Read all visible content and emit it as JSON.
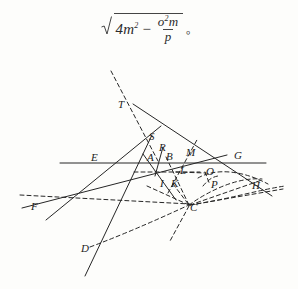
{
  "formula": {
    "name": "square-root-expression",
    "radical_symbol": "√",
    "term1_base": "4m",
    "term1_exp": "2",
    "operator": "−",
    "fraction_numerator_base": "o",
    "fraction_numerator_exp": "2",
    "fraction_numerator_tail": "m",
    "fraction_denominator": "p",
    "trailing_punctuation": "。",
    "plain_text": "√(4m² − o²m/p)。"
  },
  "figure": {
    "stroke_color": "#262626",
    "background_color": "#fdfdfb",
    "point_labels": [
      {
        "id": "T",
        "text": "T",
        "x": 118,
        "y": 99
      },
      {
        "id": "S",
        "text": "S",
        "x": 149,
        "y": 131
      },
      {
        "id": "R",
        "text": "R",
        "x": 159,
        "y": 142
      },
      {
        "id": "E",
        "text": "E",
        "x": 91,
        "y": 152
      },
      {
        "id": "A",
        "text": "A",
        "x": 147,
        "y": 152
      },
      {
        "id": "B",
        "text": "B",
        "x": 166,
        "y": 151
      },
      {
        "id": "M",
        "text": "M",
        "x": 186,
        "y": 147
      },
      {
        "id": "G",
        "text": "G",
        "x": 234,
        "y": 150
      },
      {
        "id": "L",
        "text": "L",
        "x": 180,
        "y": 165
      },
      {
        "id": "O",
        "text": "O",
        "x": 206,
        "y": 166
      },
      {
        "id": "I",
        "text": "I",
        "x": 160,
        "y": 178
      },
      {
        "id": "K",
        "text": "K",
        "x": 171,
        "y": 178
      },
      {
        "id": "P",
        "text": "P",
        "x": 211,
        "y": 179
      },
      {
        "id": "H",
        "text": "H",
        "x": 252,
        "y": 180
      },
      {
        "id": "F",
        "text": "F",
        "x": 31,
        "y": 201
      },
      {
        "id": "C",
        "text": "C",
        "x": 190,
        "y": 202
      },
      {
        "id": "D",
        "text": "D",
        "x": 81,
        "y": 243
      }
    ],
    "solid_lines": [
      {
        "name": "horizontal-line-EG",
        "x1": 60,
        "y1": 163,
        "x2": 266,
        "y2": 163
      },
      {
        "name": "line-T-to-H",
        "x1": 133,
        "y1": 104,
        "x2": 272,
        "y2": 196
      },
      {
        "name": "line-E-through-S-up",
        "x1": 46,
        "y1": 220,
        "x2": 161,
        "y2": 126
      },
      {
        "name": "line-S-to-D",
        "x1": 152,
        "y1": 135,
        "x2": 85,
        "y2": 276
      },
      {
        "name": "line-F-to-G",
        "x1": 22,
        "y1": 208,
        "x2": 227,
        "y2": 155
      },
      {
        "name": "line-A-down-right",
        "x1": 143,
        "y1": 154,
        "x2": 176,
        "y2": 200
      },
      {
        "name": "line-R-to-I",
        "x1": 163,
        "y1": 147,
        "x2": 155,
        "y2": 176
      }
    ],
    "dashed_lines": [
      {
        "name": "dashed-line-through-T",
        "x1": 111,
        "y1": 71,
        "x2": 158,
        "y2": 161
      },
      {
        "name": "dashed-line-M-upright",
        "x1": 168,
        "y1": 193,
        "x2": 198,
        "y2": 138
      },
      {
        "name": "dashed-horizontal-IL",
        "x1": 134,
        "y1": 172,
        "x2": 200,
        "y2": 172
      },
      {
        "name": "dashed-horizontal-FC",
        "x1": 20,
        "y1": 195,
        "x2": 190,
        "y2": 204
      },
      {
        "name": "dashed-B-to-C",
        "x1": 166,
        "y1": 157,
        "x2": 189,
        "y2": 205
      },
      {
        "name": "dashed-I-to-C",
        "x1": 147,
        "y1": 186,
        "x2": 189,
        "y2": 205
      },
      {
        "name": "dashed-K-to-C",
        "x1": 173,
        "y1": 184,
        "x2": 189,
        "y2": 205
      },
      {
        "name": "dashed-C-down",
        "x1": 189,
        "y1": 206,
        "x2": 170,
        "y2": 241
      },
      {
        "name": "dashed-C-to-H",
        "x1": 190,
        "y1": 205,
        "x2": 262,
        "y2": 180
      },
      {
        "name": "dashed-C-to-right",
        "x1": 190,
        "y1": 205,
        "x2": 283,
        "y2": 189
      },
      {
        "name": "dashed-O-to-P",
        "x1": 205,
        "y1": 172,
        "x2": 210,
        "y2": 185
      },
      {
        "name": "dashed-L-to-O",
        "x1": 176,
        "y1": 172,
        "x2": 206,
        "y2": 173
      }
    ],
    "dashed_curves": [
      {
        "name": "arc-C-to-H-outer",
        "path": "M189,205 C 210,190 238,177 262,179"
      },
      {
        "name": "arc-O-to-H",
        "path": "M198,178 C 215,168 242,170 268,184"
      },
      {
        "name": "arc-D-to-C",
        "path": "M90,247 C 130,232 165,216 189,205"
      },
      {
        "name": "arc-C-to-far-right",
        "path": "M190,205 C 225,200 258,190 285,186"
      },
      {
        "name": "arc-P-small",
        "path": "M203,186 C 208,180 212,177 218,176"
      }
    ]
  }
}
